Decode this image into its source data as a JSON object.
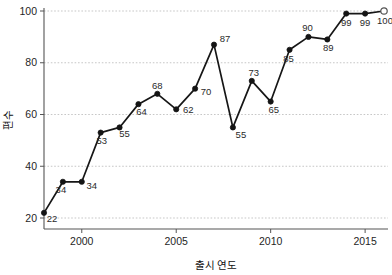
{
  "chart_data": {
    "type": "line",
    "title": "",
    "xlabel": "출시 연도",
    "ylabel": "편수",
    "x": [
      1998,
      1999,
      2000,
      2001,
      2002,
      2003,
      2004,
      2005,
      2006,
      2007,
      2008,
      2009,
      2010,
      2011,
      2012,
      2013,
      2014,
      2015,
      2016
    ],
    "values": [
      22,
      34,
      34,
      53,
      55,
      64,
      68,
      62,
      70,
      87,
      55,
      73,
      65,
      85,
      90,
      89,
      99,
      99,
      100
    ],
    "point_labels": [
      "22",
      "34",
      "34",
      "53",
      "55",
      "64",
      "68",
      "62",
      "70",
      "87",
      "55",
      "73",
      "65",
      "85",
      "90",
      "89",
      "99",
      "99",
      "100"
    ],
    "xlim": [
      1998,
      2016
    ],
    "ylim": [
      20,
      100
    ],
    "xticks": [
      2000,
      2005,
      2010,
      2015
    ],
    "xtick_labels": [
      "2000",
      "2005",
      "2010",
      "2015"
    ],
    "yticks": [
      20,
      40,
      60,
      80,
      100
    ],
    "ytick_labels": [
      "20",
      "40",
      "60",
      "80",
      "100"
    ],
    "grid": "horizontal-dashed",
    "legend": "none",
    "marker": "filled-circle",
    "last_marker": "open-circle",
    "line_color": "#161616",
    "marker_color": "#141414",
    "grid_color": "#b9b9b9",
    "axis_color": "#555555",
    "background": "#ffffff",
    "label_offsets": [
      {
        "dx": 8,
        "dy": 9
      },
      {
        "dx": -2,
        "dy": 11
      },
      {
        "dx": 10,
        "dy": 7
      },
      {
        "dx": 1,
        "dy": 11
      },
      {
        "dx": 5,
        "dy": 10
      },
      {
        "dx": 3,
        "dy": 11
      },
      {
        "dx": 0,
        "dy": -5
      },
      {
        "dx": 12,
        "dy": 4
      },
      {
        "dx": 11,
        "dy": 6
      },
      {
        "dx": 11,
        "dy": -3
      },
      {
        "dx": 8,
        "dy": 11
      },
      {
        "dx": 2,
        "dy": -5
      },
      {
        "dx": 3,
        "dy": 11
      },
      {
        "dx": -1,
        "dy": 12
      },
      {
        "dx": -1,
        "dy": -6
      },
      {
        "dx": 1,
        "dy": 12
      },
      {
        "dx": 0,
        "dy": 12
      },
      {
        "dx": 0,
        "dy": 12
      },
      {
        "dx": 1,
        "dy": 13
      }
    ]
  }
}
